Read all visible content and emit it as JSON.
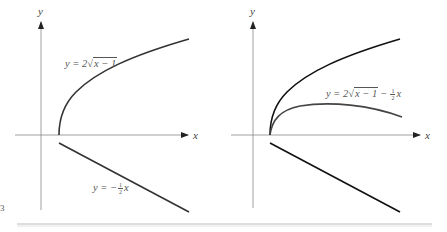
{
  "figure": {
    "edge_glyph": "3",
    "left_panel": {
      "x_axis_label": "x",
      "y_axis_label": "y",
      "curve_top_label": {
        "prefix": "y = 2",
        "radicand": "x − 1"
      },
      "line_label": {
        "prefix": "y = −",
        "num": "1",
        "den": "2",
        "suffix": "x"
      }
    },
    "right_panel": {
      "x_axis_label": "x",
      "y_axis_label": "y",
      "sum_label": {
        "prefix": "y = 2",
        "radicand": "x − 1",
        "minus": " − ",
        "num": "1",
        "den": "2",
        "suffix": "x"
      }
    }
  }
}
